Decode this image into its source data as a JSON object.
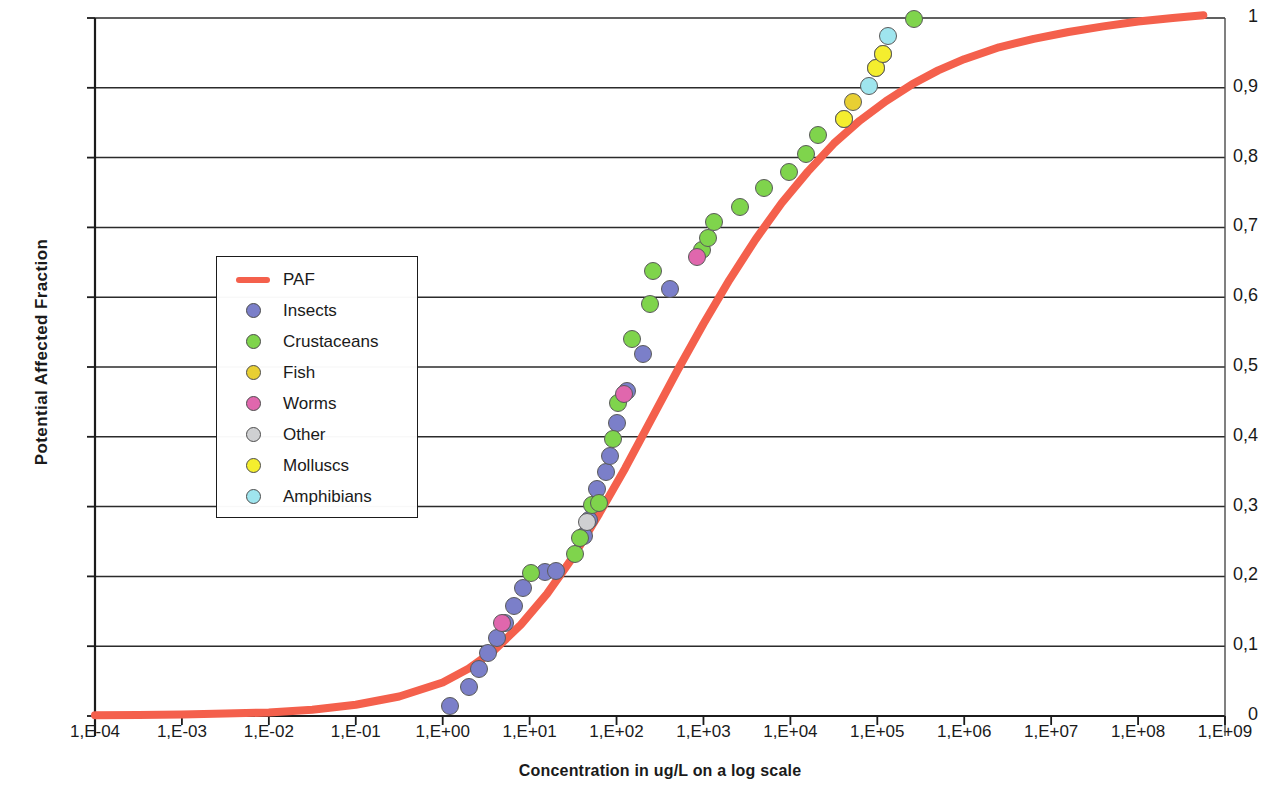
{
  "chart_data": {
    "type": "scatter",
    "title": "",
    "xlabel": "Concentration in ug/L on a log scale",
    "ylabel": "Potential Affected Fraction",
    "grid": "horizontal",
    "legend_position": "inside-left",
    "xlim_log10": [
      -4,
      9
    ],
    "ylim": [
      0,
      1
    ],
    "xtick_labels": [
      "1,E-04",
      "1,E-03",
      "1,E-02",
      "1,E-01",
      "1,E+00",
      "1,E+01",
      "1,E+02",
      "1,E+03",
      "1,E+04",
      "1,E+05",
      "1,E+06",
      "1,E+07",
      "1,E+08",
      "1,E+09"
    ],
    "xtick_log10": [
      -4,
      -3,
      -2,
      -1,
      0,
      1,
      2,
      3,
      4,
      5,
      6,
      7,
      8,
      9
    ],
    "ytick_labels": [
      "0",
      "0,1",
      "0,2",
      "0,3",
      "0,4",
      "0,5",
      "0,6",
      "0,7",
      "0,8",
      "0,9",
      "1"
    ],
    "ytick_values": [
      0,
      0.1,
      0.2,
      0.3,
      0.4,
      0.5,
      0.6,
      0.7,
      0.8,
      0.9,
      1
    ],
    "series": [
      {
        "name": "PAF",
        "type": "line",
        "color": "#f4604c",
        "points": [
          {
            "x_log10": -4.0,
            "y": 0.001
          },
          {
            "x_log10": -3.5,
            "y": 0.0015
          },
          {
            "x_log10": -3.0,
            "y": 0.002
          },
          {
            "x_log10": -2.5,
            "y": 0.0035
          },
          {
            "x_log10": -2.0,
            "y": 0.005
          },
          {
            "x_log10": -1.5,
            "y": 0.009
          },
          {
            "x_log10": -1.0,
            "y": 0.016
          },
          {
            "x_log10": -0.5,
            "y": 0.028
          },
          {
            "x_log10": 0.0,
            "y": 0.048
          },
          {
            "x_log10": 0.3,
            "y": 0.068
          },
          {
            "x_log10": 0.6,
            "y": 0.095
          },
          {
            "x_log10": 0.9,
            "y": 0.131
          },
          {
            "x_log10": 1.2,
            "y": 0.175
          },
          {
            "x_log10": 1.5,
            "y": 0.228
          },
          {
            "x_log10": 1.8,
            "y": 0.29
          },
          {
            "x_log10": 2.1,
            "y": 0.355
          },
          {
            "x_log10": 2.4,
            "y": 0.425
          },
          {
            "x_log10": 2.7,
            "y": 0.495
          },
          {
            "x_log10": 3.0,
            "y": 0.562
          },
          {
            "x_log10": 3.3,
            "y": 0.625
          },
          {
            "x_log10": 3.6,
            "y": 0.683
          },
          {
            "x_log10": 3.9,
            "y": 0.735
          },
          {
            "x_log10": 4.2,
            "y": 0.78
          },
          {
            "x_log10": 4.5,
            "y": 0.82
          },
          {
            "x_log10": 4.8,
            "y": 0.853
          },
          {
            "x_log10": 5.1,
            "y": 0.881
          },
          {
            "x_log10": 5.4,
            "y": 0.905
          },
          {
            "x_log10": 5.7,
            "y": 0.925
          },
          {
            "x_log10": 6.0,
            "y": 0.941
          },
          {
            "x_log10": 6.4,
            "y": 0.958
          },
          {
            "x_log10": 6.8,
            "y": 0.97
          },
          {
            "x_log10": 7.2,
            "y": 0.98
          },
          {
            "x_log10": 7.6,
            "y": 0.988
          },
          {
            "x_log10": 8.0,
            "y": 0.995
          },
          {
            "x_log10": 8.4,
            "y": 1.0
          },
          {
            "x_log10": 8.75,
            "y": 1.004
          }
        ]
      },
      {
        "name": "Insects",
        "type": "scatter",
        "color": "#7b7fc9",
        "points": [
          {
            "x_log10": 0.08,
            "y": 0.015
          },
          {
            "x_log10": 0.3,
            "y": 0.042
          },
          {
            "x_log10": 0.42,
            "y": 0.068
          },
          {
            "x_log10": 0.52,
            "y": 0.09
          },
          {
            "x_log10": 0.62,
            "y": 0.112
          },
          {
            "x_log10": 0.72,
            "y": 0.133
          },
          {
            "x_log10": 0.82,
            "y": 0.158
          },
          {
            "x_log10": 0.92,
            "y": 0.183
          },
          {
            "x_log10": 1.18,
            "y": 0.206
          },
          {
            "x_log10": 1.3,
            "y": 0.208
          },
          {
            "x_log10": 1.62,
            "y": 0.258
          },
          {
            "x_log10": 1.68,
            "y": 0.281
          },
          {
            "x_log10": 1.78,
            "y": 0.325
          },
          {
            "x_log10": 1.88,
            "y": 0.35
          },
          {
            "x_log10": 1.92,
            "y": 0.373
          },
          {
            "x_log10": 2.0,
            "y": 0.42
          },
          {
            "x_log10": 2.12,
            "y": 0.466
          },
          {
            "x_log10": 2.3,
            "y": 0.518
          },
          {
            "x_log10": 2.62,
            "y": 0.612
          }
        ]
      },
      {
        "name": "Crustaceans",
        "type": "scatter",
        "color": "#7fd44c",
        "points": [
          {
            "x_log10": 1.02,
            "y": 0.205
          },
          {
            "x_log10": 1.52,
            "y": 0.232
          },
          {
            "x_log10": 1.58,
            "y": 0.255
          },
          {
            "x_log10": 1.72,
            "y": 0.302
          },
          {
            "x_log10": 1.8,
            "y": 0.305
          },
          {
            "x_log10": 1.96,
            "y": 0.397
          },
          {
            "x_log10": 2.02,
            "y": 0.448
          },
          {
            "x_log10": 2.18,
            "y": 0.54
          },
          {
            "x_log10": 2.38,
            "y": 0.59
          },
          {
            "x_log10": 2.42,
            "y": 0.637
          },
          {
            "x_log10": 2.98,
            "y": 0.667
          },
          {
            "x_log10": 3.05,
            "y": 0.685
          },
          {
            "x_log10": 3.12,
            "y": 0.708
          },
          {
            "x_log10": 3.42,
            "y": 0.73
          },
          {
            "x_log10": 3.7,
            "y": 0.757
          },
          {
            "x_log10": 3.98,
            "y": 0.78
          },
          {
            "x_log10": 4.18,
            "y": 0.805
          },
          {
            "x_log10": 4.32,
            "y": 0.832
          },
          {
            "x_log10": 5.42,
            "y": 0.998
          }
        ]
      },
      {
        "name": "Fish",
        "type": "scatter",
        "color": "#e8cf33",
        "points": [
          {
            "x_log10": 4.62,
            "y": 0.855
          },
          {
            "x_log10": 4.72,
            "y": 0.88
          },
          {
            "x_log10": 4.98,
            "y": 0.928
          },
          {
            "x_log10": 5.06,
            "y": 0.948
          }
        ]
      },
      {
        "name": "Worms",
        "type": "scatter",
        "color": "#e067ad",
        "points": [
          {
            "x_log10": 0.68,
            "y": 0.133
          },
          {
            "x_log10": 2.08,
            "y": 0.462
          },
          {
            "x_log10": 2.92,
            "y": 0.658
          }
        ]
      },
      {
        "name": "Other",
        "type": "scatter",
        "color": "#cfd0d2",
        "points": [
          {
            "x_log10": 1.66,
            "y": 0.278
          }
        ]
      },
      {
        "name": "Molluscs",
        "type": "scatter",
        "color": "#f4ee2e",
        "points": [
          {
            "x_log10": 4.62,
            "y": 0.855
          },
          {
            "x_log10": 4.98,
            "y": 0.928
          },
          {
            "x_log10": 5.06,
            "y": 0.948
          }
        ]
      },
      {
        "name": "Amphibians",
        "type": "scatter",
        "color": "#9fe5ee",
        "points": [
          {
            "x_log10": 4.9,
            "y": 0.903
          },
          {
            "x_log10": 5.12,
            "y": 0.975
          }
        ]
      }
    ]
  },
  "legend": {
    "items": [
      {
        "label": "PAF",
        "marker": "line",
        "color": "#f4604c"
      },
      {
        "label": "Insects",
        "marker": "dot",
        "color": "#7b7fc9"
      },
      {
        "label": "Crustaceans",
        "marker": "dot",
        "color": "#7fd44c"
      },
      {
        "label": "Fish",
        "marker": "dot",
        "color": "#e8cf33"
      },
      {
        "label": "Worms",
        "marker": "dot",
        "color": "#e067ad"
      },
      {
        "label": "Other",
        "marker": "dot",
        "color": "#cfd0d2"
      },
      {
        "label": "Molluscs",
        "marker": "dot",
        "color": "#f4ee2e"
      },
      {
        "label": "Amphibians",
        "marker": "dot",
        "color": "#9fe5ee"
      }
    ]
  }
}
